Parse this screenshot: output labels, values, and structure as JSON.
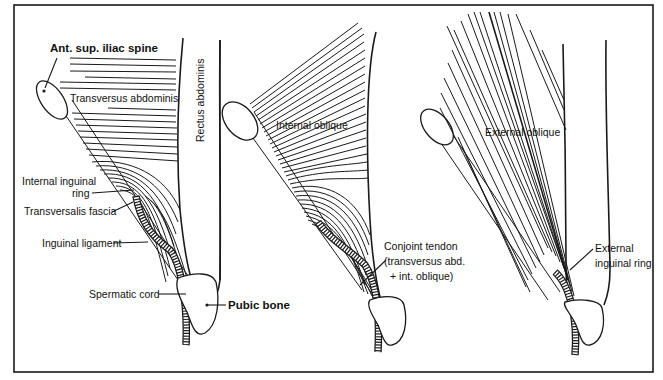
{
  "figure": {
    "frame_color": "#1a1a1a",
    "background": "#ffffff",
    "panels": [
      {
        "id": "panel-1",
        "layer": "Transversus abdominis",
        "labels": {
          "asis": "Ant. sup. iliac spine",
          "muscle": "Transversus abdominis",
          "rectus": "Rectus abdominis",
          "internal_ring_line1": "Internal inguinal",
          "internal_ring_line2": "ring",
          "transversalis": "Transversalis fascia",
          "inguinal_ligament": "Inguinal ligament",
          "spermatic_cord": "Spermatic cord",
          "pubic_bone": "Pubic bone"
        }
      },
      {
        "id": "panel-2",
        "layer": "Internal oblique",
        "labels": {
          "muscle": "Internal oblique",
          "conjoint_line1": "Conjoint tendon",
          "conjoint_line2": "(transversus abd.",
          "conjoint_line3": "+ int. oblique)"
        }
      },
      {
        "id": "panel-3",
        "layer": "External oblique",
        "labels": {
          "muscle": "External oblique",
          "external_ring_line1": "External",
          "external_ring_line2": "inguinal ring"
        }
      }
    ]
  }
}
